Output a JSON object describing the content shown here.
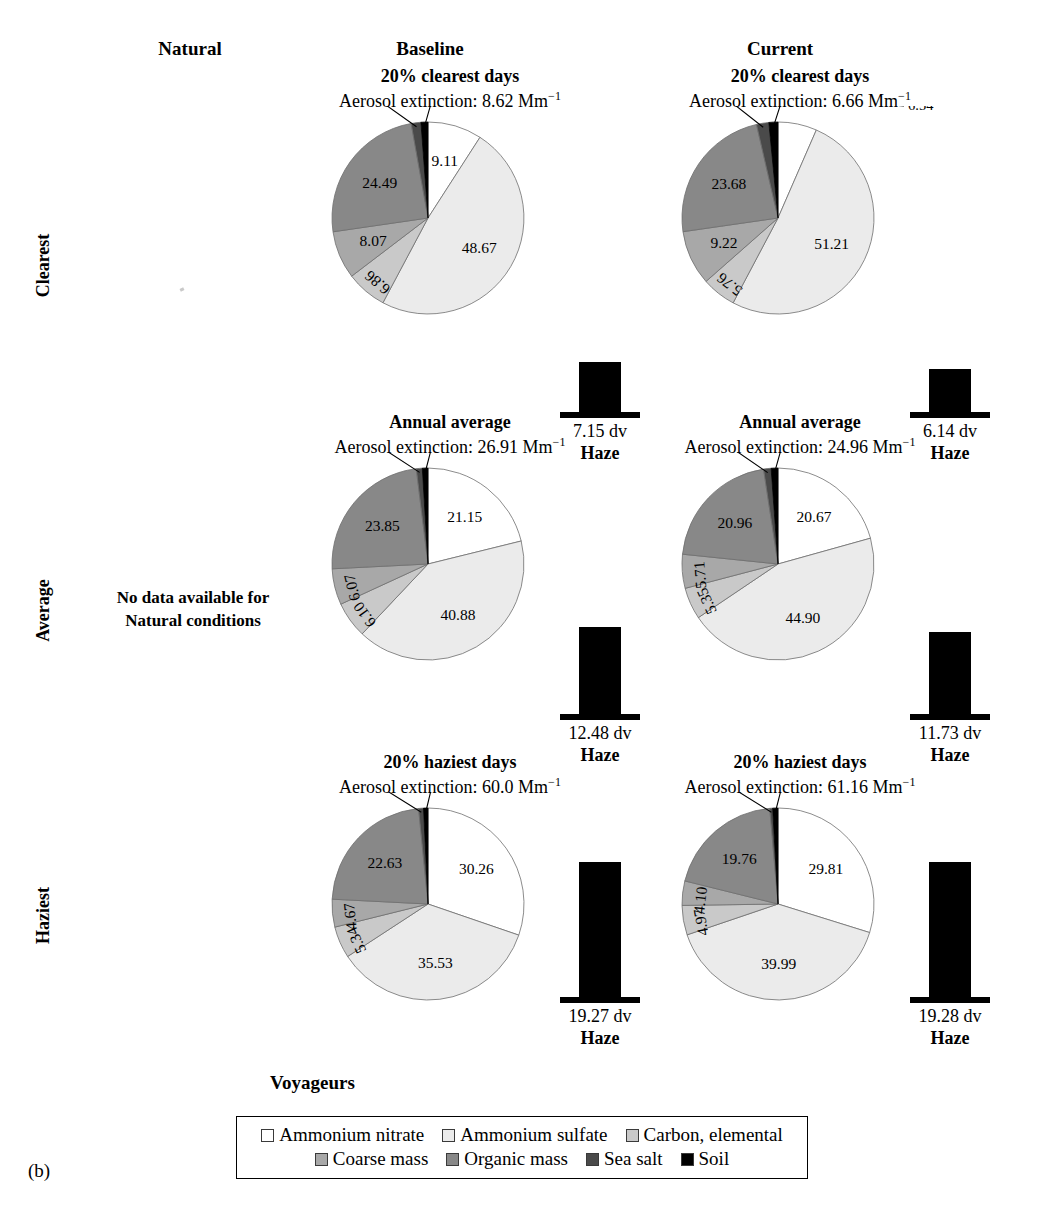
{
  "figure": {
    "caption_label": "(b)",
    "site_title": "Voyageurs",
    "column_headers": [
      "Natural",
      "Baseline",
      "Current"
    ],
    "row_headers": [
      "Clearest",
      "Average",
      "Haziest"
    ],
    "no_data_note": "No data available for\nNatural conditions",
    "no_data_line1": "No data available for",
    "no_data_line2": "Natural conditions",
    "haze_caption": "Haze",
    "extinction_prefix": "Aerosol extinction: ",
    "extinction_unit": "Mm",
    "extinction_exponent": "−1"
  },
  "legend": {
    "rows": [
      [
        {
          "label": "Ammonium nitrate",
          "color": "#ffffff"
        },
        {
          "label": "Ammonium sulfate",
          "color": "#ebebeb"
        },
        {
          "label": "Carbon, elemental",
          "color": "#c9c9c9"
        }
      ],
      [
        {
          "label": "Coarse mass",
          "color": "#a8a8a8"
        },
        {
          "label": "Organic mass",
          "color": "#888888"
        },
        {
          "label": "Sea salt",
          "color": "#4a4a4a"
        },
        {
          "label": "Soil",
          "color": "#000000"
        }
      ]
    ]
  },
  "chart_data": [
    {
      "type": "pie",
      "id": "baseline-clearest",
      "column": "Baseline",
      "row": "Clearest",
      "title": "20% clearest days",
      "subtitle": "Aerosol extinction: 8.62 Mm−1",
      "extinction_value": "8.62",
      "labels": [
        "Ammonium nitrate",
        "Ammonium sulfate",
        "Carbon, elemental",
        "Coarse mass",
        "Organic mass",
        "Sea salt",
        "Soil"
      ],
      "values": [
        9.11,
        48.67,
        6.86,
        8.07,
        24.49,
        1.63,
        1.18
      ],
      "value_texts": [
        "9.11",
        "48.67",
        "6.86",
        "8.07",
        "24.49",
        "1.63",
        "1.18"
      ],
      "haze": {
        "value": "7.15 dv",
        "number": 7.15,
        "caption": "Haze"
      }
    },
    {
      "type": "pie",
      "id": "current-clearest",
      "column": "Current",
      "row": "Clearest",
      "title": "20% clearest days",
      "subtitle": "Aerosol extinction: 6.66 Mm−1",
      "extinction_value": "6.66",
      "labels": [
        "Ammonium nitrate",
        "Ammonium sulfate",
        "Carbon, elemental",
        "Coarse mass",
        "Organic mass",
        "Sea salt",
        "Soil"
      ],
      "values": [
        6.54,
        51.21,
        5.76,
        9.22,
        23.68,
        2.07,
        1.53
      ],
      "value_texts": [
        "6.54",
        "51.21",
        "5.76",
        "9.22",
        "23.68",
        "2.07",
        "1.53"
      ],
      "haze": {
        "value": "6.14 dv",
        "number": 6.14,
        "caption": "Haze"
      }
    },
    {
      "type": "pie",
      "id": "baseline-average",
      "column": "Baseline",
      "row": "Average",
      "title": "Annual average",
      "subtitle": "Aerosol extinction: 26.91 Mm−1",
      "extinction_value": "26.91",
      "labels": [
        "Ammonium nitrate",
        "Ammonium sulfate",
        "Carbon, elemental",
        "Coarse mass",
        "Organic mass",
        "Sea salt",
        "Soil"
      ],
      "values": [
        21.15,
        40.88,
        6.1,
        6.07,
        23.85,
        1.0,
        0.95
      ],
      "value_texts": [
        "21.15",
        "40.88",
        "6.10",
        "6.07",
        "23.85",
        "1.00",
        "0.95"
      ],
      "haze": {
        "value": "12.48 dv",
        "number": 12.48,
        "caption": "Haze"
      }
    },
    {
      "type": "pie",
      "id": "current-average",
      "column": "Current",
      "row": "Average",
      "title": "Annual average",
      "subtitle": "Aerosol extinction: 24.96 Mm−1",
      "extinction_value": "24.96",
      "labels": [
        "Ammonium nitrate",
        "Ammonium sulfate",
        "Carbon, elemental",
        "Coarse mass",
        "Organic mass",
        "Sea salt",
        "Soil"
      ],
      "values": [
        20.67,
        44.9,
        5.35,
        5.71,
        20.96,
        1.26,
        1.15
      ],
      "value_texts": [
        "20.67",
        "44.90",
        "5.35",
        "5.71",
        "20.96",
        "1.26",
        "1.15"
      ],
      "haze": {
        "value": "11.73 dv",
        "number": 11.73,
        "caption": "Haze"
      }
    },
    {
      "type": "pie",
      "id": "baseline-haziest",
      "column": "Baseline",
      "row": "Haziest",
      "title": "20% haziest days",
      "subtitle": "Aerosol extinction: 60.0 Mm−1",
      "extinction_value": "60.0",
      "labels": [
        "Ammonium nitrate",
        "Ammonium sulfate",
        "Carbon, elemental",
        "Coarse mass",
        "Organic mass",
        "Sea salt",
        "Soil"
      ],
      "values": [
        30.26,
        35.53,
        5.34,
        4.67,
        22.63,
        0.82,
        0.75
      ],
      "value_texts": [
        "30.26",
        "35.53",
        "5.34",
        "4.67",
        "22.63",
        "0.82",
        "0.75"
      ],
      "haze": {
        "value": "19.27 dv",
        "number": 19.27,
        "caption": "Haze"
      }
    },
    {
      "type": "pie",
      "id": "current-haziest",
      "column": "Current",
      "row": "Haziest",
      "title": "20% haziest days",
      "subtitle": "Aerosol extinction: 61.16 Mm−1",
      "extinction_value": "61.16",
      "labels": [
        "Ammonium nitrate",
        "Ammonium sulfate",
        "Carbon, elemental",
        "Coarse mass",
        "Organic mass",
        "Sea salt",
        "Soil"
      ],
      "values": [
        29.81,
        39.99,
        4.97,
        4.1,
        19.76,
        0.49,
        0.89
      ],
      "value_texts": [
        "29.81",
        "39.99",
        "4.97",
        "4.10",
        "19.76",
        "0.49",
        "0.89"
      ],
      "haze": {
        "value": "19.28 dv",
        "number": 19.28,
        "caption": "Haze"
      }
    }
  ]
}
